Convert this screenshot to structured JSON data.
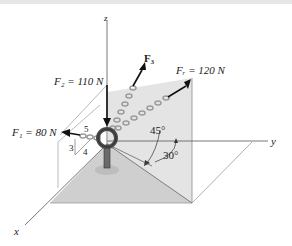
{
  "diagram": {
    "axes": {
      "z": "z",
      "y": "y",
      "x": "x"
    },
    "forces": {
      "F1": {
        "label": "F₁ = 80 N"
      },
      "F2": {
        "label": "F₂ = 110 N"
      },
      "F3": {
        "label": "F₃"
      },
      "FR": {
        "label": "Fᵣ = 120 N"
      }
    },
    "slope_triangle": {
      "hyp": "5",
      "rise": "3",
      "run": "4"
    },
    "angles": {
      "a45": "45°",
      "a30": "30°"
    },
    "colors": {
      "plane": "#dcdcdc",
      "floor": "#c8c8c8",
      "chain": "#9a9a9a",
      "ring": "#5a5a5a",
      "arrow": "#111111",
      "axis": "#555555"
    }
  }
}
